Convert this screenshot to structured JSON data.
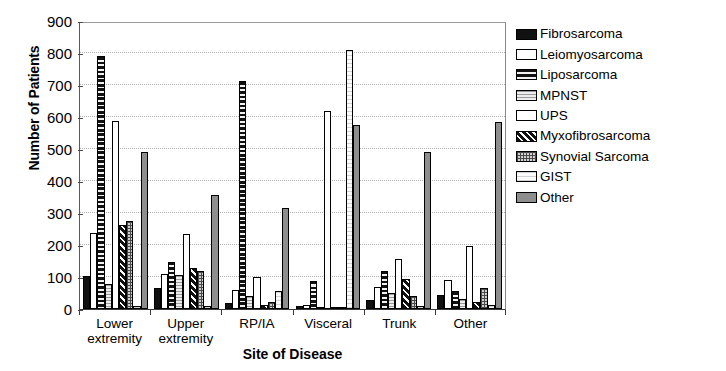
{
  "chart_data": {
    "type": "bar",
    "title": "",
    "xlabel": "Site of Disease",
    "ylabel": "Number of Patients",
    "ylim": [
      0,
      900
    ],
    "yticks": [
      0,
      100,
      200,
      300,
      400,
      500,
      600,
      700,
      800,
      900
    ],
    "grid": true,
    "legend_position": "right",
    "categories": [
      "Lower extremity",
      "Upper extremity",
      "RP/IA",
      "Visceral",
      "Trunk",
      "Other"
    ],
    "category_lines": [
      [
        "Lower",
        "extremity"
      ],
      [
        "Upper",
        "extremity"
      ],
      [
        "RP/IA",
        ""
      ],
      [
        "Visceral",
        ""
      ],
      [
        "Trunk",
        ""
      ],
      [
        "Other",
        ""
      ]
    ],
    "series": [
      {
        "name": "Fibrosarcoma",
        "pattern": "solid-black",
        "values": [
          103,
          66,
          20,
          9,
          28,
          43
        ]
      },
      {
        "name": "Leiomyosarcoma",
        "pattern": "white-open",
        "values": [
          237,
          110,
          58,
          12,
          70,
          90
        ]
      },
      {
        "name": "Liposarcoma",
        "pattern": "black-horizontal",
        "values": [
          790,
          148,
          712,
          88,
          120,
          57
        ]
      },
      {
        "name": "MPNST",
        "pattern": "grey-fine",
        "values": [
          78,
          105,
          40,
          7,
          49,
          32
        ]
      },
      {
        "name": "UPS",
        "pattern": "white-open",
        "values": [
          588,
          235,
          100,
          620,
          155,
          196
        ]
      },
      {
        "name": "Myxofibrosarcoma",
        "pattern": "black-diagonal",
        "values": [
          261,
          128,
          13,
          6,
          93,
          21
        ]
      },
      {
        "name": "Synovial Sarcoma",
        "pattern": "grey-checker",
        "values": [
          276,
          118,
          22,
          5,
          41,
          67
        ]
      },
      {
        "name": "GIST",
        "pattern": "light-speckle",
        "values": [
          9,
          8,
          57,
          808,
          10,
          12
        ]
      },
      {
        "name": "Other",
        "pattern": "solid-grey",
        "values": [
          492,
          357,
          316,
          576,
          492,
          584
        ]
      }
    ]
  },
  "axis": {
    "y_tick_labels": [
      "900",
      "800",
      "700",
      "600",
      "500",
      "400",
      "300",
      "200",
      "100",
      "0"
    ],
    "y_title": "Number of Patients",
    "x_title": "Site of Disease"
  },
  "legend": {
    "items": [
      {
        "label": "Fibrosarcoma"
      },
      {
        "label": "Leiomyosarcoma"
      },
      {
        "label": "Liposarcoma"
      },
      {
        "label": "MPNST"
      },
      {
        "label": "UPS"
      },
      {
        "label": "Myxofibrosarcoma"
      },
      {
        "label": "Synovial Sarcoma"
      },
      {
        "label": "GIST"
      },
      {
        "label": "Other"
      }
    ]
  }
}
